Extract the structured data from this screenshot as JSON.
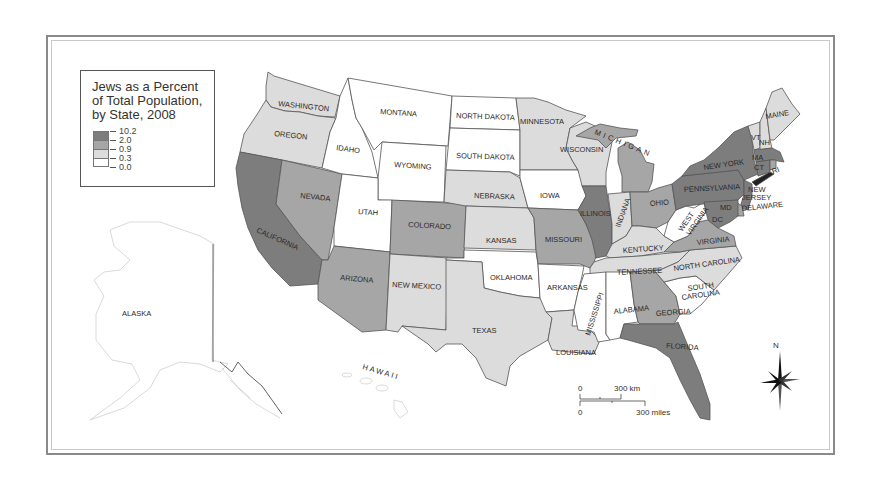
{
  "legend": {
    "title": "Jews as a Percent of Total Population, by State, 2008",
    "title_lines": [
      "Jews as a Percent",
      "of Total Population,",
      "by State, 2008"
    ],
    "breaks": [
      "10.2",
      "2.0",
      "0.9",
      "0.3",
      "0.0"
    ],
    "classes": [
      {
        "range": "2.0–10.2",
        "color": "#7d7d7d"
      },
      {
        "range": "0.9–2.0",
        "color": "#a6a6a6"
      },
      {
        "range": "0.3–0.9",
        "color": "#dcdcdc"
      },
      {
        "range": "0.0–0.3",
        "color": "#ffffff"
      }
    ]
  },
  "colors": {
    "c4": "#7d7d7d",
    "c3": "#a6a6a6",
    "c2": "#dcdcdc",
    "c1": "#ffffff",
    "border": "#555555",
    "frame": "#8a8a8a"
  },
  "states": [
    {
      "name": "WASHINGTON",
      "class": 2
    },
    {
      "name": "OREGON",
      "class": 2
    },
    {
      "name": "CALIFORNIA",
      "class": 4
    },
    {
      "name": "NEVADA",
      "class": 3
    },
    {
      "name": "IDAHO",
      "class": 1
    },
    {
      "name": "MONTANA",
      "class": 1
    },
    {
      "name": "WYOMING",
      "class": 1
    },
    {
      "name": "UTAH",
      "class": 1
    },
    {
      "name": "ARIZONA",
      "class": 3
    },
    {
      "name": "COLORADO",
      "class": 3
    },
    {
      "name": "NEW MEXICO",
      "class": 2
    },
    {
      "name": "NORTH DAKOTA",
      "class": 1
    },
    {
      "name": "SOUTH DAKOTA",
      "class": 1
    },
    {
      "name": "NEBRASKA",
      "class": 2
    },
    {
      "name": "KANSAS",
      "class": 2
    },
    {
      "name": "OKLAHOMA",
      "class": 1
    },
    {
      "name": "TEXAS",
      "class": 2
    },
    {
      "name": "MINNESOTA",
      "class": 2
    },
    {
      "name": "IOWA",
      "class": 1
    },
    {
      "name": "MISSOURI",
      "class": 3
    },
    {
      "name": "ARKANSAS",
      "class": 1
    },
    {
      "name": "LOUISIANA",
      "class": 2
    },
    {
      "name": "WISCONSIN",
      "class": 2
    },
    {
      "name": "ILLINOIS",
      "class": 4
    },
    {
      "name": "MICHIGAN",
      "class": 3
    },
    {
      "name": "INDIANA",
      "class": 2
    },
    {
      "name": "OHIO",
      "class": 3
    },
    {
      "name": "KENTUCKY",
      "class": 2
    },
    {
      "name": "TENNESSEE",
      "class": 2
    },
    {
      "name": "MISSISSIPPI",
      "class": 1
    },
    {
      "name": "ALABAMA",
      "class": 1
    },
    {
      "name": "GEORGIA",
      "class": 3
    },
    {
      "name": "FLORIDA",
      "class": 4
    },
    {
      "name": "SOUTH CAROLINA",
      "class": 1
    },
    {
      "name": "NORTH CAROLINA",
      "class": 2
    },
    {
      "name": "VIRGINIA",
      "class": 3
    },
    {
      "name": "WEST VIRGINIA",
      "class": 1
    },
    {
      "name": "PENNSYLVANIA",
      "class": 4
    },
    {
      "name": "NEW YORK",
      "class": 4
    },
    {
      "name": "NEW JERSEY",
      "class": 4
    },
    {
      "name": "DELAWARE",
      "class": 3
    },
    {
      "name": "MD",
      "class": 4
    },
    {
      "name": "DC",
      "class": 4
    },
    {
      "name": "VT",
      "class": 2
    },
    {
      "name": "NH",
      "class": 2
    },
    {
      "name": "MAINE",
      "class": 2
    },
    {
      "name": "MA",
      "class": 4
    },
    {
      "name": "CT",
      "class": 4
    },
    {
      "name": "RI",
      "class": 3
    },
    {
      "name": "ALASKA",
      "class": 1
    },
    {
      "name": "HAWAII",
      "class": 1
    }
  ],
  "labels": {
    "washington": "WASHINGTON",
    "oregon": "OREGON",
    "california": "CALIFORNIA",
    "nevada": "NEVADA",
    "idaho": "IDAHO",
    "montana": "MONTANA",
    "wyoming": "WYOMING",
    "utah": "UTAH",
    "arizona": "ARIZONA",
    "colorado": "COLORADO",
    "new_mexico": "NEW MEXICO",
    "north_dakota": "NORTH DAKOTA",
    "south_dakota": "SOUTH DAKOTA",
    "nebraska": "NEBRASKA",
    "kansas": "KANSAS",
    "oklahoma": "OKLAHOMA",
    "texas": "TEXAS",
    "minnesota": "MINNESOTA",
    "iowa": "IOWA",
    "missouri": "MISSOURI",
    "arkansas": "ARKANSAS",
    "louisiana": "LOUISIANA",
    "wisconsin": "WISCONSIN",
    "illinois": "ILLINOIS",
    "michigan": "MICHIGAN",
    "indiana": "INDIANA",
    "ohio": "OHIO",
    "kentucky": "KENTUCKY",
    "tennessee": "TENNESSEE",
    "mississippi": "MISSISSIPPI",
    "alabama": "ALABAMA",
    "georgia": "GEORGIA",
    "florida": "FLORIDA",
    "south_carolina_1": "SOUTH",
    "south_carolina_2": "CAROLINA",
    "north_carolina": "NORTH CAROLINA",
    "virginia": "VIRGINIA",
    "west_virginia_1": "WEST",
    "west_virginia_2": "VIRGINIA",
    "pennsylvania": "PENNSYLVANIA",
    "new_york": "NEW YORK",
    "new_jersey_1": "NEW",
    "new_jersey_2": "JERSEY",
    "delaware": "DELAWARE",
    "md": "MD",
    "dc": "DC",
    "vt": "VT",
    "nh": "NH",
    "maine": "MAINE",
    "ma": "MA",
    "ct": "CT",
    "ri": "RI",
    "alaska": "ALASKA",
    "hawaii": "HAWAII"
  },
  "scale_bar": {
    "km_zero": "0",
    "km_label": "300 km",
    "mi_zero": "0",
    "mi_label": "300 miles"
  },
  "north_arrow": {
    "label": "N"
  }
}
